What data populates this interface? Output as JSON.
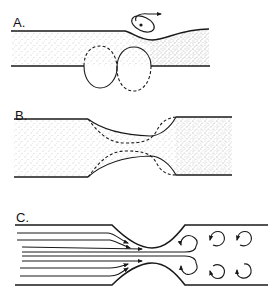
{
  "figure": {
    "panels": [
      {
        "id": "A",
        "label": "A.",
        "description": "Tube with pinched wall and vortex ring above; figure-eight vessel outline below"
      },
      {
        "id": "B",
        "label": "B.",
        "description": "Constricted tube with dashed alternate wall profile"
      },
      {
        "id": "C",
        "label": "C.",
        "description": "Flow streamlines through constriction with downstream recirculating vortices"
      }
    ]
  },
  "colors": {
    "ink": "#1a1a1a",
    "stipple": "#8a8a8a",
    "background": "#ffffff"
  }
}
